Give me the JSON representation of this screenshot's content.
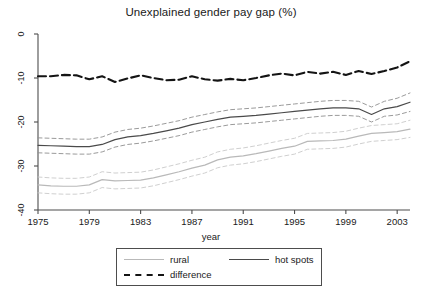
{
  "chart_data": {
    "type": "line",
    "title": "Unexplained gender pay gap (%)",
    "xlabel": "year",
    "ylabel": "",
    "xlim": [
      1975,
      2004
    ],
    "ylim": [
      -40,
      0
    ],
    "grid": false,
    "legend_position": "bottom",
    "xticks": [
      1975,
      1979,
      1983,
      1987,
      1991,
      1995,
      1999,
      2003
    ],
    "yticks": [
      0,
      -10,
      -20,
      -30,
      -40
    ],
    "x": [
      1975,
      1976,
      1977,
      1978,
      1979,
      1980,
      1981,
      1982,
      1983,
      1984,
      1985,
      1986,
      1987,
      1988,
      1989,
      1990,
      1991,
      1992,
      1993,
      1994,
      1995,
      1996,
      1997,
      1998,
      1999,
      2000,
      2001,
      2002,
      2003,
      2004
    ],
    "series": [
      {
        "name": "hot spots",
        "style": "solid",
        "color": "#4a4a4a",
        "values": [
          -25.3,
          -25.4,
          -25.5,
          -25.6,
          -25.6,
          -25.1,
          -24.0,
          -23.4,
          -23.1,
          -22.6,
          -22.0,
          -21.4,
          -20.6,
          -20.0,
          -19.4,
          -18.9,
          -18.7,
          -18.5,
          -18.2,
          -17.9,
          -17.6,
          -17.3,
          -17.0,
          -16.8,
          -16.8,
          -17.0,
          -18.3,
          -17.0,
          -16.5,
          -15.5
        ]
      },
      {
        "name": "hot spots upper CI",
        "style": "dashed",
        "color": "#8f8f8f",
        "values": [
          -23.6,
          -23.7,
          -23.8,
          -23.9,
          -23.9,
          -23.4,
          -22.3,
          -21.7,
          -21.4,
          -20.9,
          -20.3,
          -19.7,
          -18.9,
          -18.3,
          -17.7,
          -17.2,
          -17.0,
          -16.8,
          -16.5,
          -16.2,
          -15.9,
          -15.6,
          -15.3,
          -15.1,
          -15.1,
          -15.3,
          -16.6,
          -15.3,
          -14.6,
          -13.4
        ]
      },
      {
        "name": "hot spots lower CI",
        "style": "dashed",
        "color": "#8f8f8f",
        "values": [
          -27.0,
          -27.1,
          -27.2,
          -27.3,
          -27.3,
          -26.8,
          -25.7,
          -25.1,
          -24.8,
          -24.3,
          -23.7,
          -23.1,
          -22.3,
          -21.7,
          -21.1,
          -20.6,
          -20.4,
          -20.2,
          -19.9,
          -19.6,
          -19.3,
          -19.0,
          -18.7,
          -18.5,
          -18.5,
          -18.7,
          -20.0,
          -18.7,
          -18.4,
          -17.6
        ]
      },
      {
        "name": "rural",
        "style": "solid",
        "color": "#b9b9b9",
        "values": [
          -34.3,
          -34.5,
          -34.6,
          -34.6,
          -34.3,
          -33.1,
          -33.4,
          -33.3,
          -33.2,
          -32.7,
          -32.0,
          -31.3,
          -30.5,
          -29.8,
          -28.6,
          -28.0,
          -27.7,
          -27.2,
          -26.6,
          -26.0,
          -25.5,
          -24.4,
          -24.3,
          -24.2,
          -23.9,
          -23.2,
          -22.6,
          -22.4,
          -22.2,
          -21.6
        ]
      },
      {
        "name": "rural upper CI",
        "style": "dashed",
        "color": "#c9c9c9",
        "values": [
          -32.5,
          -32.7,
          -32.8,
          -32.8,
          -32.5,
          -31.3,
          -31.6,
          -31.5,
          -31.4,
          -30.9,
          -30.2,
          -29.5,
          -28.7,
          -28.0,
          -26.8,
          -26.2,
          -25.9,
          -25.4,
          -24.8,
          -24.2,
          -23.7,
          -22.6,
          -22.5,
          -22.4,
          -22.1,
          -21.4,
          -20.8,
          -20.6,
          -20.4,
          -19.6
        ]
      },
      {
        "name": "rural lower CI",
        "style": "dashed",
        "color": "#c9c9c9",
        "values": [
          -36.1,
          -36.3,
          -36.4,
          -36.4,
          -36.1,
          -34.9,
          -35.2,
          -35.1,
          -35.0,
          -34.5,
          -33.8,
          -33.1,
          -32.3,
          -31.6,
          -30.4,
          -29.8,
          -29.5,
          -29.0,
          -28.4,
          -27.8,
          -27.3,
          -26.2,
          -26.1,
          -26.0,
          -25.7,
          -25.0,
          -24.4,
          -24.2,
          -24.0,
          -23.5
        ]
      },
      {
        "name": "difference",
        "style": "dashed",
        "color": "#141414",
        "values": [
          -9.6,
          -9.6,
          -9.3,
          -9.4,
          -10.3,
          -9.6,
          -10.9,
          -10.1,
          -9.4,
          -10.0,
          -10.5,
          -10.4,
          -9.6,
          -10.3,
          -10.6,
          -10.2,
          -10.5,
          -10.0,
          -9.4,
          -9.0,
          -9.4,
          -8.6,
          -9.0,
          -8.6,
          -9.3,
          -8.4,
          -9.1,
          -8.4,
          -7.6,
          -6.2
        ]
      }
    ]
  },
  "legend": {
    "items": [
      {
        "label": "rural",
        "style": "solid-light"
      },
      {
        "label": "hot spots",
        "style": "solid-dark"
      },
      {
        "label": "difference",
        "style": "dashed-dark"
      }
    ]
  }
}
